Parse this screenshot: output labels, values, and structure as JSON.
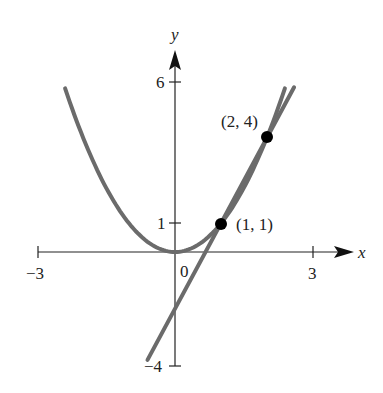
{
  "chart_data": {
    "type": "line",
    "title": "",
    "xlabel": "x",
    "ylabel": "y",
    "xlim": [
      -3,
      3
    ],
    "ylim": [
      -4,
      6
    ],
    "grid": false,
    "x_ticks": [
      {
        "value": -3,
        "label": "−3"
      },
      {
        "value": 3,
        "label": "3"
      }
    ],
    "y_ticks": [
      {
        "value": 6,
        "label": "6"
      },
      {
        "value": 1,
        "label": "1"
      },
      {
        "value": -4,
        "label": "−4"
      }
    ],
    "origin_label": "0",
    "series": [
      {
        "name": "parabola",
        "equation": "y = x^2",
        "x_range": [
          -2.4,
          2.4
        ],
        "color": "#6b6b6b"
      },
      {
        "name": "tangent line",
        "equation": "y = 3x - 2",
        "x_range": [
          -0.6,
          2.6
        ],
        "color": "#6b6b6b"
      }
    ],
    "points": [
      {
        "x": 1,
        "y": 1,
        "label": "(1, 1)"
      },
      {
        "x": 2,
        "y": 4,
        "label": "(2, 4)"
      }
    ]
  },
  "labels": {
    "x_axis": "x",
    "y_axis": "y",
    "tick_neg3": "−3",
    "tick_3": "3",
    "tick_6": "6",
    "tick_1": "1",
    "tick_neg4": "−4",
    "origin": "0",
    "point_a": "(1, 1)",
    "point_b": "(2, 4)"
  },
  "colors": {
    "curve": "#6b6b6b",
    "axis": "#222222",
    "point": "#000000"
  }
}
